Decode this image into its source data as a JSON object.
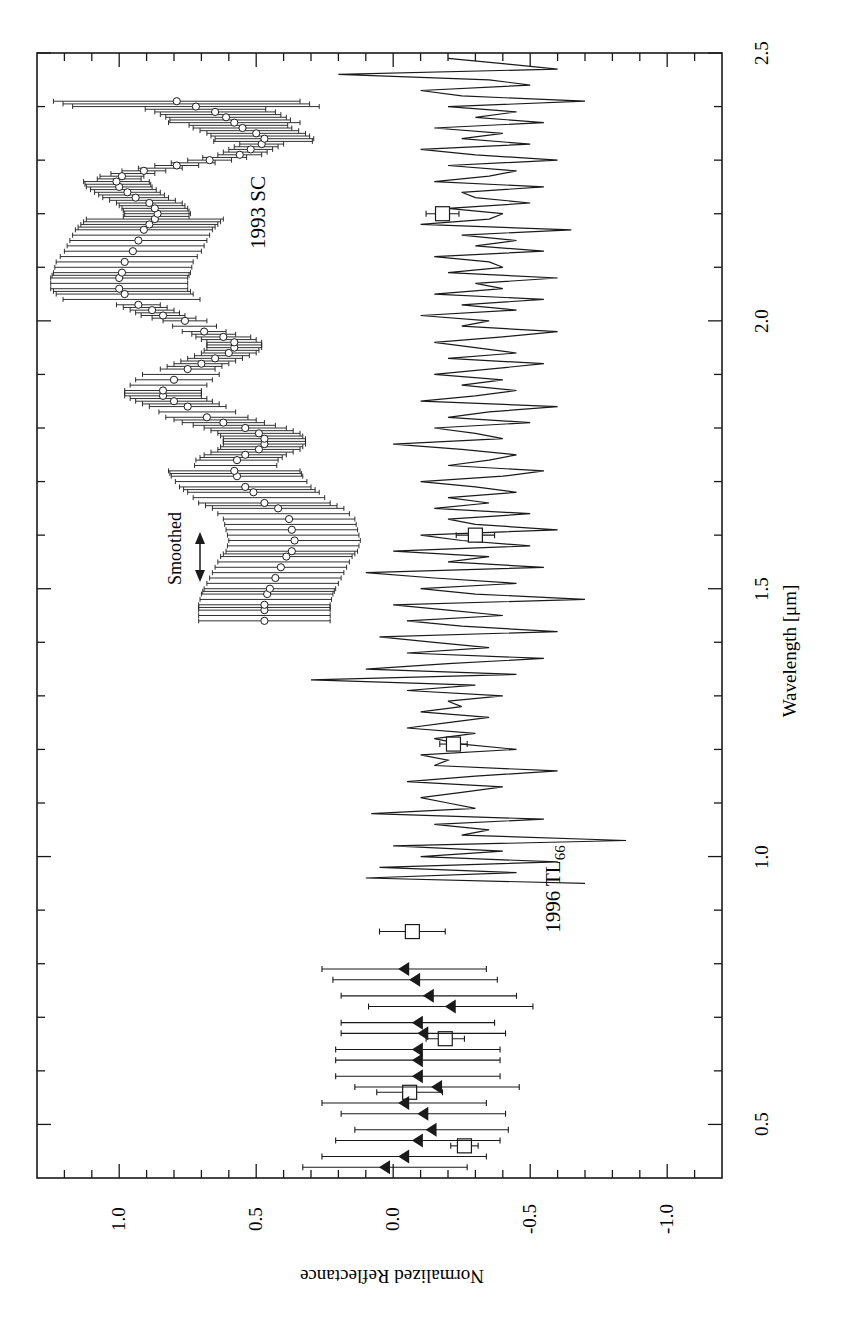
{
  "figure": {
    "orientation": "rotated-90-ccw",
    "xlabel": "Wavelength [μm]",
    "ylabel": "Normalized Reflectance",
    "x_ticks": [
      "0.5",
      "1.0",
      "1.5",
      "2.0",
      "2.5"
    ],
    "y_ticks": [
      "1.0",
      "0.5",
      "0.0",
      "-0.5",
      "-1.0"
    ],
    "labels": {
      "sc": "1993 SC",
      "tl_main": "1996 TL",
      "tl_sub": "66",
      "smoothed": "Smoothed"
    },
    "colors": {
      "ink": "#1a1a1a",
      "background": "#ffffff"
    }
  },
  "chart_data": {
    "type": "scatter",
    "title": "",
    "xlabel": "Wavelength [μm]",
    "ylabel": "Normalized Reflectance",
    "xlim": [
      0.4,
      2.5
    ],
    "ylim": [
      -1.2,
      1.3
    ],
    "x_ticks_major": [
      0.5,
      1.0,
      1.5,
      2.0,
      2.5
    ],
    "x_ticks_minor_step": 0.1,
    "y_ticks_major": [
      1.0,
      0.5,
      0.0,
      -0.5,
      -1.0
    ],
    "y_ticks_minor_step": 0.1,
    "grid": false,
    "legend": null,
    "annotations": [
      {
        "text": "1993 SC",
        "x": 2.08,
        "y": 0.55
      },
      {
        "text": "1996 TL66",
        "x": 0.85,
        "y": -0.6
      },
      {
        "text": "Smoothed",
        "x": 1.55,
        "y": 0.78,
        "arrow": "double-headed along wavelength"
      }
    ],
    "series": [
      {
        "name": "1993 SC (smoothed, open circles with error bars)",
        "marker": "open-circle",
        "error_bar_half_width": 0.22,
        "x": [
          1.44,
          1.46,
          1.47,
          1.49,
          1.5,
          1.52,
          1.54,
          1.56,
          1.57,
          1.59,
          1.61,
          1.63,
          1.65,
          1.66,
          1.68,
          1.69,
          1.71,
          1.72,
          1.74,
          1.75,
          1.76,
          1.77,
          1.78,
          1.79,
          1.8,
          1.81,
          1.82,
          1.84,
          1.85,
          1.86,
          1.87,
          1.89,
          1.91,
          1.92,
          1.93,
          1.94,
          1.95,
          1.96,
          1.97,
          1.98,
          2.0,
          2.01,
          2.02,
          2.03,
          2.05,
          2.06,
          2.08,
          2.09,
          2.11,
          2.13,
          2.15,
          2.17,
          2.18,
          2.19,
          2.2,
          2.21,
          2.22,
          2.23,
          2.24,
          2.25,
          2.26,
          2.27,
          2.28,
          2.29,
          2.3,
          2.31,
          2.32,
          2.33,
          2.34,
          2.35,
          2.36,
          2.37,
          2.38,
          2.39,
          2.4,
          2.41
        ],
        "y": [
          0.47,
          0.47,
          0.47,
          0.46,
          0.45,
          0.43,
          0.41,
          0.39,
          0.37,
          0.36,
          0.37,
          0.38,
          0.42,
          0.47,
          0.51,
          0.54,
          0.57,
          0.58,
          0.57,
          0.54,
          0.49,
          0.47,
          0.47,
          0.49,
          0.54,
          0.62,
          0.68,
          0.75,
          0.8,
          0.84,
          0.84,
          0.8,
          0.75,
          0.7,
          0.65,
          0.6,
          0.58,
          0.58,
          0.62,
          0.69,
          0.76,
          0.84,
          0.88,
          0.93,
          0.98,
          1.0,
          1.0,
          0.99,
          0.98,
          0.95,
          0.93,
          0.91,
          0.89,
          0.87,
          0.86,
          0.87,
          0.89,
          0.94,
          0.97,
          1.0,
          1.01,
          0.99,
          0.91,
          0.79,
          0.67,
          0.56,
          0.52,
          0.48,
          0.47,
          0.5,
          0.55,
          0.58,
          0.61,
          0.65,
          0.72,
          0.79
        ],
        "error_scale_note": "error bars widen from ~0.05 near 2.0-2.3 transition to ~0.25 at 1.5-1.7 and 2.1, and up to ~0.45 at 2.41"
      },
      {
        "name": "1996 TL66 spectrum (noisy line)",
        "marker": "none",
        "x": [
          0.95,
          0.96,
          0.97,
          0.98,
          0.99,
          1.0,
          1.01,
          1.02,
          1.03,
          1.04,
          1.05,
          1.06,
          1.07,
          1.08,
          1.09,
          1.1,
          1.11,
          1.12,
          1.13,
          1.14,
          1.15,
          1.16,
          1.17,
          1.18,
          1.19,
          1.2,
          1.21,
          1.22,
          1.23,
          1.24,
          1.25,
          1.26,
          1.27,
          1.28,
          1.29,
          1.3,
          1.31,
          1.32,
          1.33,
          1.34,
          1.35,
          1.36,
          1.37,
          1.38,
          1.39,
          1.4,
          1.41,
          1.42,
          1.43,
          1.44,
          1.45,
          1.46,
          1.47,
          1.48,
          1.49,
          1.5,
          1.51,
          1.52,
          1.53,
          1.54,
          1.55,
          1.56,
          1.57,
          1.58,
          1.59,
          1.6,
          1.61,
          1.62,
          1.63,
          1.64,
          1.65,
          1.66,
          1.67,
          1.68,
          1.69,
          1.7,
          1.71,
          1.72,
          1.73,
          1.74,
          1.75,
          1.76,
          1.77,
          1.78,
          1.79,
          1.8,
          1.81,
          1.82,
          1.83,
          1.84,
          1.85,
          1.86,
          1.87,
          1.88,
          1.89,
          1.9,
          1.91,
          1.92,
          1.93,
          1.94,
          1.95,
          1.96,
          1.97,
          1.98,
          1.99,
          2.0,
          2.01,
          2.02,
          2.03,
          2.04,
          2.05,
          2.06,
          2.07,
          2.08,
          2.09,
          2.1,
          2.11,
          2.12,
          2.13,
          2.14,
          2.15,
          2.16,
          2.17,
          2.18,
          2.19,
          2.2,
          2.21,
          2.22,
          2.23,
          2.24,
          2.25,
          2.26,
          2.27,
          2.28,
          2.29,
          2.3,
          2.31,
          2.32,
          2.33,
          2.34,
          2.35,
          2.36,
          2.37,
          2.38,
          2.39,
          2.4,
          2.41,
          2.42,
          2.43,
          2.44,
          2.45,
          2.46,
          2.47,
          2.48,
          2.49
        ],
        "y": [
          -0.7,
          0.1,
          -0.45,
          0.05,
          -0.6,
          -0.1,
          -0.4,
          0.0,
          -0.85,
          -0.25,
          -0.35,
          -0.15,
          -0.55,
          0.08,
          -0.3,
          -0.2,
          -0.1,
          -0.25,
          -0.4,
          -0.05,
          -0.3,
          -0.6,
          -0.15,
          -0.2,
          -0.1,
          -0.45,
          -0.25,
          -0.15,
          -0.3,
          -0.05,
          -0.2,
          -0.35,
          -0.1,
          -0.25,
          -0.2,
          -0.4,
          -0.05,
          -0.3,
          0.3,
          -0.45,
          0.1,
          -0.2,
          -0.55,
          -0.05,
          -0.35,
          -0.15,
          0.05,
          -0.6,
          -0.25,
          -0.05,
          -0.4,
          -0.2,
          0.0,
          -0.7,
          -0.3,
          -0.1,
          -0.45,
          -0.15,
          0.1,
          -0.55,
          -0.2,
          -0.35,
          0.0,
          -0.5,
          -0.25,
          -0.1,
          -0.6,
          -0.3,
          -0.2,
          -0.5,
          -0.15,
          -0.35,
          -0.2,
          -0.45,
          -0.3,
          -0.1,
          -0.4,
          -0.55,
          -0.2,
          -0.35,
          -0.45,
          -0.25,
          0.0,
          -0.4,
          -0.3,
          -0.15,
          -0.5,
          -0.2,
          -0.35,
          -0.6,
          -0.1,
          -0.3,
          -0.45,
          -0.25,
          -0.4,
          -0.15,
          -0.35,
          -0.55,
          -0.2,
          -0.45,
          -0.3,
          -0.15,
          -0.4,
          -0.6,
          -0.25,
          -0.35,
          -0.1,
          -0.45,
          -0.25,
          -0.55,
          -0.15,
          -0.4,
          -0.3,
          -0.6,
          -0.2,
          -0.4,
          -0.35,
          -0.15,
          -0.55,
          -0.3,
          -0.45,
          -0.25,
          -0.65,
          -0.1,
          -0.35,
          -0.4,
          -0.2,
          -0.5,
          -0.3,
          -0.25,
          -0.55,
          -0.15,
          -0.35,
          -0.45,
          -0.2,
          -0.6,
          -0.3,
          -0.1,
          -0.5,
          -0.25,
          -0.4,
          -0.15,
          -0.55,
          -0.3,
          -0.45,
          -0.2,
          -0.7,
          -0.25,
          -0.1,
          -0.5,
          -0.35,
          0.2,
          -0.6,
          -0.4,
          -0.2
        ]
      },
      {
        "name": "Photometry (open squares with error bars)",
        "marker": "open-square",
        "x": [
          0.46,
          0.56,
          0.66,
          0.86,
          1.21,
          1.6,
          2.2
        ],
        "y": [
          -0.26,
          -0.06,
          -0.19,
          -0.07,
          -0.22,
          -0.3,
          -0.18
        ],
        "error": [
          0.05,
          0.12,
          0.07,
          0.12,
          0.05,
          0.07,
          0.06
        ]
      },
      {
        "name": "Spectrophotometry (filled triangles with error bars)",
        "marker": "filled-triangle-left",
        "x": [
          0.42,
          0.44,
          0.47,
          0.49,
          0.52,
          0.54,
          0.57,
          0.59,
          0.62,
          0.64,
          0.67,
          0.69,
          0.72,
          0.74,
          0.77,
          0.79
        ],
        "y": [
          0.03,
          -0.04,
          -0.09,
          -0.14,
          -0.11,
          -0.04,
          -0.16,
          -0.09,
          -0.09,
          -0.09,
          -0.11,
          -0.09,
          -0.21,
          -0.13,
          -0.08,
          -0.04
        ],
        "error": [
          0.3,
          0.3,
          0.3,
          0.28,
          0.3,
          0.3,
          0.3,
          0.3,
          0.3,
          0.3,
          0.3,
          0.28,
          0.3,
          0.32,
          0.3,
          0.3
        ]
      }
    ]
  }
}
